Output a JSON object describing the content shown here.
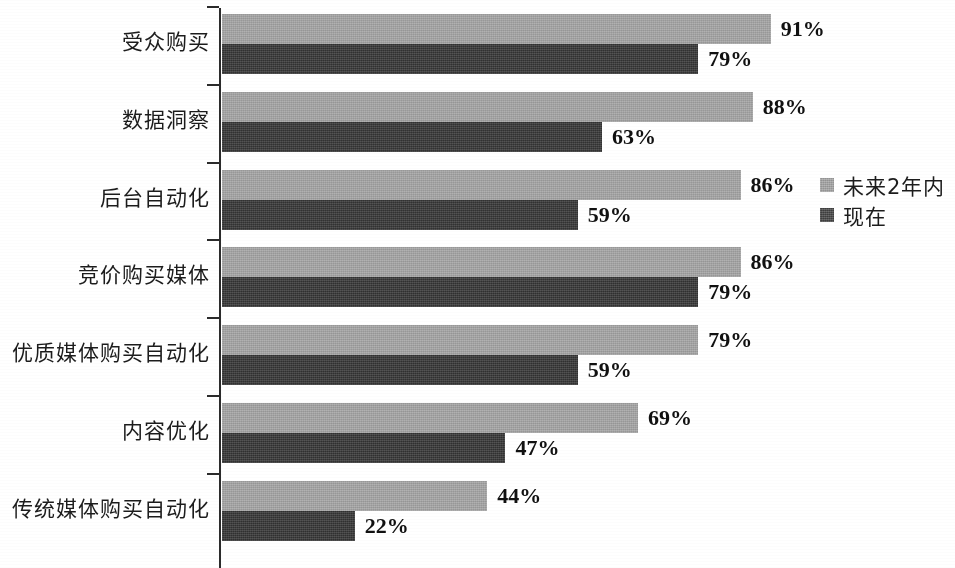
{
  "chart_data": {
    "type": "bar",
    "orientation": "horizontal",
    "title": "",
    "xlabel": "",
    "ylabel": "",
    "grid": false,
    "legend_position": "right",
    "xlim": [
      0,
      100
    ],
    "value_suffix": "%",
    "categories": [
      "受众购买",
      "数据洞察",
      "后台自动化",
      "竞价购买媒体",
      "优质媒体购买自动化",
      "内容优化",
      "传统媒体购买自动化"
    ],
    "series": [
      {
        "name": "未来2年内",
        "color": "#a6a6a6",
        "values": [
          91,
          88,
          86,
          86,
          79,
          69,
          44
        ],
        "labels": [
          "91%",
          "88%",
          "86%",
          "86%",
          "79%",
          "69%",
          "44%"
        ]
      },
      {
        "name": "现在",
        "color": "#3b3b3b",
        "values": [
          79,
          63,
          59,
          79,
          59,
          47,
          22
        ],
        "labels": [
          "79%",
          "63%",
          "59%",
          "79%",
          "59%",
          "47%",
          "22%"
        ]
      }
    ]
  },
  "legend": {
    "items": [
      {
        "label": "未来2年内",
        "swatch": "future"
      },
      {
        "label": "现在",
        "swatch": "now"
      }
    ]
  },
  "axis": {
    "tick_count": 7
  }
}
